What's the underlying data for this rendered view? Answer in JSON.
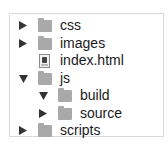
{
  "tree": {
    "items": [
      {
        "label": "css",
        "type": "folder",
        "expanded": false,
        "depth": 0
      },
      {
        "label": "images",
        "type": "folder",
        "expanded": false,
        "depth": 0
      },
      {
        "label": "index.html",
        "type": "file",
        "depth": 0
      },
      {
        "label": "js",
        "type": "folder",
        "expanded": true,
        "depth": 0
      },
      {
        "label": "build",
        "type": "folder",
        "expanded": true,
        "depth": 1
      },
      {
        "label": "source",
        "type": "folder",
        "expanded": false,
        "depth": 1
      },
      {
        "label": "scripts",
        "type": "folder",
        "expanded": false,
        "depth": 0
      }
    ]
  }
}
